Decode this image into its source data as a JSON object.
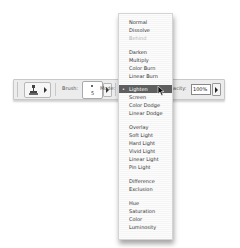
{
  "toolbar": {
    "tool_icon": "clone-stamp-icon",
    "brush_label": "Brush:",
    "brush_size": "5",
    "mode_label": "Mode:",
    "opacity_label": "Opacity:",
    "opacity_value": "100%"
  },
  "blend_mode_menu": {
    "selected": "Lighten",
    "check_mark": "•",
    "items": [
      {
        "label": "Normal",
        "state": "normal"
      },
      {
        "label": "Dissolve",
        "state": "normal"
      },
      {
        "label": "Behind",
        "state": "disabled"
      },
      {
        "label": "Darken",
        "state": "normal"
      },
      {
        "label": "Multiply",
        "state": "normal"
      },
      {
        "label": "Color Burn",
        "state": "normal"
      },
      {
        "label": "Linear Burn",
        "state": "normal"
      },
      {
        "label": "Lighten",
        "state": "selected"
      },
      {
        "label": "Screen",
        "state": "normal"
      },
      {
        "label": "Color Dodge",
        "state": "normal"
      },
      {
        "label": "Linear Dodge",
        "state": "normal"
      },
      {
        "label": "Overlay",
        "state": "normal"
      },
      {
        "label": "Soft Light",
        "state": "normal"
      },
      {
        "label": "Hard Light",
        "state": "normal"
      },
      {
        "label": "Vivid Light",
        "state": "normal"
      },
      {
        "label": "Linear Light",
        "state": "normal"
      },
      {
        "label": "Pin Light",
        "state": "normal"
      },
      {
        "label": "Difference",
        "state": "normal"
      },
      {
        "label": "Exclusion",
        "state": "normal"
      },
      {
        "label": "Hue",
        "state": "normal"
      },
      {
        "label": "Saturation",
        "state": "normal"
      },
      {
        "label": "Color",
        "state": "normal"
      },
      {
        "label": "Luminosity",
        "state": "normal"
      }
    ]
  },
  "colors": {
    "highlight": "#5f5f5f",
    "toolbar_bg": "#ececec",
    "menu_bg": "#fbfbfb"
  }
}
